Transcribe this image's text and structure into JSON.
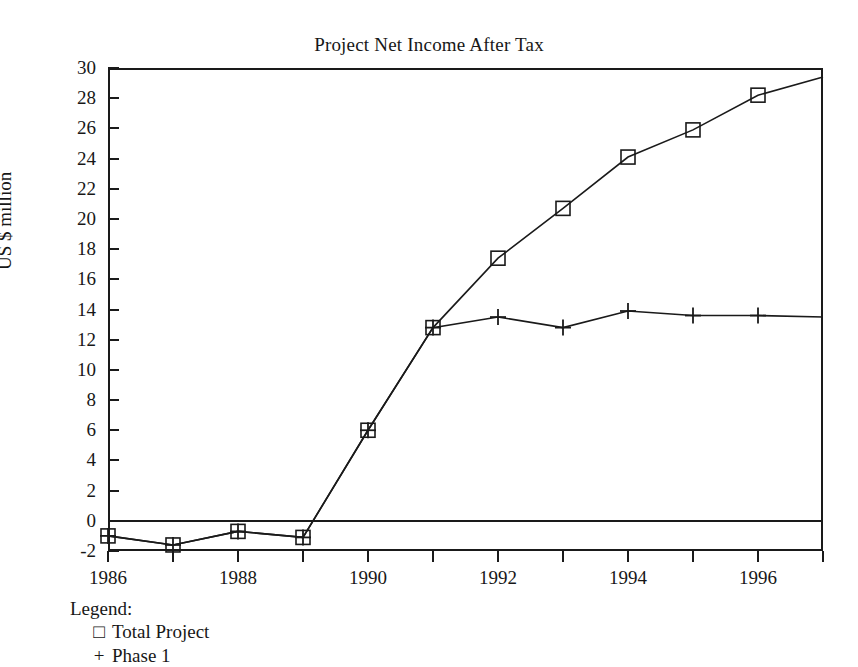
{
  "chart_data": {
    "type": "line",
    "title": "Project Net Income After Tax",
    "xlabel": "",
    "ylabel": "US $ million",
    "xlim": [
      1986,
      1997
    ],
    "ylim": [
      -2,
      30
    ],
    "ytick_step": 2,
    "xtick_step": 1,
    "xtick_label_step": 2,
    "grid": false,
    "legend_position": "below-axes-left",
    "legend_title": "Legend:",
    "x": [
      1986,
      1987,
      1988,
      1989,
      1990,
      1991,
      1992,
      1993,
      1994,
      1995,
      1996,
      1997
    ],
    "y_tick_labels": [
      "30",
      "28",
      "26",
      "24",
      "22",
      "20",
      "18",
      "16",
      "14",
      "12",
      "10",
      "8",
      "6",
      "4",
      "2",
      "0",
      "-2"
    ],
    "x_tick_labels": [
      "1986",
      "1988",
      "1990",
      "1992",
      "1994",
      "1996"
    ],
    "x_tick_label_years": [
      1986,
      1988,
      1990,
      1992,
      1994,
      1996
    ],
    "series": [
      {
        "name": "Total Project",
        "marker": "square",
        "marker_glyph": "□",
        "color": "#1a1a1a",
        "values": [
          -1.0,
          -1.6,
          -0.7,
          -1.1,
          6.0,
          12.8,
          17.4,
          20.7,
          24.1,
          25.9,
          28.2,
          29.4
        ],
        "marker_years": [
          1986,
          1987,
          1988,
          1989,
          1990,
          1991,
          1992,
          1993,
          1994,
          1995,
          1996
        ]
      },
      {
        "name": "Phase 1",
        "marker": "plus",
        "marker_glyph": "+",
        "color": "#1a1a1a",
        "values": [
          -1.0,
          -1.6,
          -0.7,
          -1.1,
          6.0,
          12.8,
          13.5,
          12.8,
          13.9,
          13.6,
          13.6,
          13.5
        ],
        "marker_years": [
          1986,
          1987,
          1988,
          1989,
          1990,
          1991,
          1992,
          1993,
          1994,
          1995,
          1996
        ]
      }
    ]
  },
  "legend": {
    "title": "Legend:",
    "entries": [
      {
        "glyph": "□",
        "label": "Total Project"
      },
      {
        "glyph": "+",
        "label": "Phase 1"
      }
    ]
  }
}
